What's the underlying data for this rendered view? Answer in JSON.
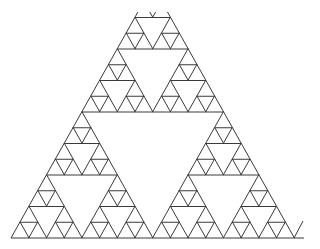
{
  "figure": {
    "title": "",
    "type": "sierpinski-triangle",
    "depth": 4,
    "rows": 16,
    "stroke_color": "#3a3a3a",
    "background_color": "#ffffff",
    "stroke_width": 1
  },
  "geometry": {
    "base_left": [
      11,
      238
    ],
    "base_right": [
      294,
      238
    ],
    "apex": [
      152.5,
      -14
    ],
    "visible_top_y": 12,
    "extra_stroke": {
      "from": [
        294,
        238
      ],
      "to": [
        303,
        221
      ]
    },
    "base_extension_to_x": 304
  }
}
